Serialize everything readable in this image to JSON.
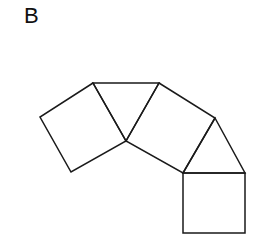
{
  "figure": {
    "panel_label": "B",
    "stroke_color": "#1a1a1a",
    "background": "#ffffff",
    "shapes": [
      {
        "type": "square",
        "name": "square-left",
        "points": "93,83 40,117 71,172 126,141"
      },
      {
        "type": "triangle",
        "name": "triangle-top",
        "points": "93,83 159,83 126,141"
      },
      {
        "type": "square",
        "name": "square-middle",
        "points": "159,83 215,118 183,173 126,141"
      },
      {
        "type": "triangle",
        "name": "triangle-right",
        "points": "215,118 245,173 183,173"
      },
      {
        "type": "square",
        "name": "square-bottom",
        "points": "183,173 245,173 245,233 183,233"
      }
    ]
  }
}
